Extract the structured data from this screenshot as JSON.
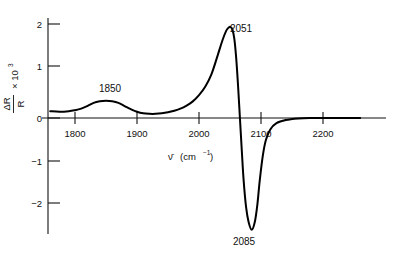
{
  "chart_data": {
    "type": "line",
    "title": "",
    "subtitle": "",
    "xlabel": "ν̄ (cm⁻¹)",
    "ylabel": "ΔR/R × 10³",
    "ylabel_numerator": "ΔR",
    "ylabel_denominator": "R",
    "ylabel_multiplier": "× 10",
    "ylabel_exponent": "3",
    "xlabel_symbol": "ν̄",
    "xlabel_units": "(cm",
    "xlabel_units_exponent": "−1",
    "xlabel_units_close": ")",
    "xlim": [
      1760,
      2260
    ],
    "ylim": [
      -2.45,
      2.25
    ],
    "xticks": [
      1800,
      1900,
      2000,
      2100,
      2200
    ],
    "xticklabels": [
      "1800",
      "1900",
      "2000",
      "2100",
      "2200"
    ],
    "yticks": [
      -2,
      -1,
      0,
      1,
      2
    ],
    "yticklabels": [
      "−2",
      "−1",
      "0",
      "1",
      "2"
    ],
    "grid": false,
    "legend": null,
    "annotations": [
      {
        "label": "1850",
        "x": 1850,
        "y": 0.33,
        "position": "above"
      },
      {
        "label": "2051",
        "x": 2051,
        "y": 1.75,
        "position": "above"
      },
      {
        "label": "2085",
        "x": 2085,
        "y": -2.15,
        "position": "below"
      }
    ],
    "series": [
      {
        "name": "reflectance difference spectrum",
        "color": "#000000",
        "x": [
          1760,
          1775,
          1790,
          1800,
          1810,
          1820,
          1830,
          1840,
          1850,
          1860,
          1870,
          1880,
          1890,
          1900,
          1910,
          1920,
          1930,
          1940,
          1950,
          1960,
          1970,
          1980,
          1990,
          2000,
          2010,
          2020,
          2030,
          2038,
          2044,
          2048,
          2051,
          2054,
          2057,
          2060,
          2063,
          2066,
          2069,
          2072,
          2076,
          2080,
          2085,
          2090,
          2094,
          2098,
          2103,
          2108,
          2115,
          2125,
          2140,
          2160,
          2180,
          2200,
          2230,
          2260
        ],
        "y": [
          0.13,
          0.12,
          0.13,
          0.15,
          0.18,
          0.23,
          0.29,
          0.32,
          0.33,
          0.32,
          0.29,
          0.23,
          0.17,
          0.12,
          0.09,
          0.08,
          0.08,
          0.09,
          0.11,
          0.14,
          0.18,
          0.24,
          0.32,
          0.44,
          0.6,
          0.84,
          1.2,
          1.5,
          1.68,
          1.74,
          1.75,
          1.7,
          1.52,
          1.15,
          0.62,
          0.0,
          -0.62,
          -1.2,
          -1.72,
          -2.0,
          -2.15,
          -2.0,
          -1.68,
          -1.2,
          -0.72,
          -0.42,
          -0.22,
          -0.1,
          -0.04,
          -0.01,
          0.0,
          0.0,
          0.0,
          0.0
        ]
      }
    ]
  },
  "figure": {
    "background_color": "#ffffff",
    "curve_color": "#000000",
    "axis_color": "#111111"
  }
}
